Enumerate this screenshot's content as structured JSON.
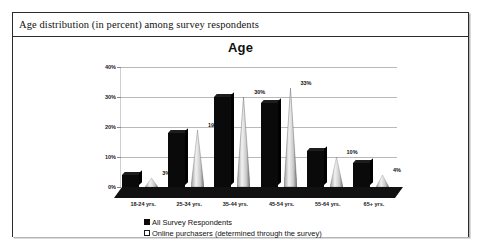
{
  "figure": {
    "caption": "Age distribution (in percent) among survey respondents"
  },
  "chart_data": {
    "type": "bar",
    "title": "Age",
    "xlabel": "",
    "ylabel": "",
    "ylim": [
      0,
      40
    ],
    "ytick_labels": [
      "0%",
      "10%",
      "20%",
      "30%",
      "40%"
    ],
    "ytick_values": [
      0,
      10,
      20,
      30,
      40
    ],
    "grid": true,
    "legend_position": "bottom-left",
    "categories": [
      "18-24 yrs.",
      "25-34 yrs.",
      "35-44 yrs.",
      "45-54 yrs.",
      "55-64 yrs.",
      "65+ yrs."
    ],
    "series": [
      {
        "name": "All Survey Respondents",
        "marker": "filled-square",
        "color": "#0a0a0a",
        "values": [
          4,
          18,
          30,
          28,
          12,
          8
        ],
        "labels": [
          "",
          "",
          "",
          "",
          "",
          ""
        ]
      },
      {
        "name": "Online purchasers (determined through the survey)",
        "marker": "hollow-square",
        "color": "#d9d9d9",
        "values": [
          3,
          19,
          30,
          33,
          10,
          4
        ],
        "labels": [
          "3%",
          "19%",
          "30%",
          "33%",
          "10%",
          "4%"
        ]
      }
    ]
  }
}
